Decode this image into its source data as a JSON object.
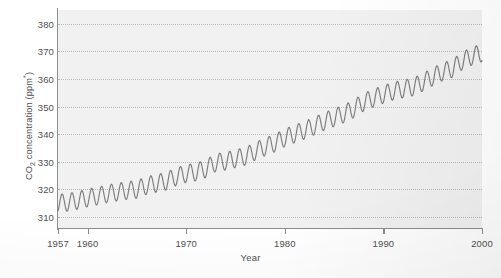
{
  "chart_data": {
    "type": "line",
    "title": "",
    "xlabel": "Year",
    "ylabel": "CO2 concentration (ppm*)",
    "ylabel_parts": {
      "prefix": "CO",
      "subscript": "2",
      "middle": " concentration (ppm",
      "superscript": "*",
      "suffix": ")"
    },
    "xlim": [
      1957,
      2000
    ],
    "ylim": [
      306,
      385
    ],
    "grid": true,
    "grid_axis": "y",
    "legend": "none",
    "yticks": [
      310,
      320,
      330,
      340,
      350,
      360,
      370,
      380
    ],
    "xticks": [
      1957,
      1960,
      1970,
      1980,
      1990,
      2000
    ],
    "series": [
      {
        "name": "Atmospheric CO2 (Mauna Loa)",
        "color": "#7c7c7c",
        "description": "Monthly mean CO2 with seasonal oscillation superimposed on rising annual trend",
        "seasonal_amplitude_ppm": 3.2,
        "seasonal_peak_month": 5,
        "annual_means": [
          {
            "year": 1957,
            "value": 315.0
          },
          {
            "year": 1958,
            "value": 315.3
          },
          {
            "year": 1959,
            "value": 316.0
          },
          {
            "year": 1960,
            "value": 316.9
          },
          {
            "year": 1961,
            "value": 317.6
          },
          {
            "year": 1962,
            "value": 318.4
          },
          {
            "year": 1963,
            "value": 319.0
          },
          {
            "year": 1964,
            "value": 319.6
          },
          {
            "year": 1965,
            "value": 320.0
          },
          {
            "year": 1966,
            "value": 321.4
          },
          {
            "year": 1967,
            "value": 322.2
          },
          {
            "year": 1968,
            "value": 323.0
          },
          {
            "year": 1969,
            "value": 324.6
          },
          {
            "year": 1970,
            "value": 325.7
          },
          {
            "year": 1971,
            "value": 326.3
          },
          {
            "year": 1972,
            "value": 327.5
          },
          {
            "year": 1973,
            "value": 329.7
          },
          {
            "year": 1974,
            "value": 330.2
          },
          {
            "year": 1975,
            "value": 331.1
          },
          {
            "year": 1976,
            "value": 332.0
          },
          {
            "year": 1977,
            "value": 333.8
          },
          {
            "year": 1978,
            "value": 335.4
          },
          {
            "year": 1979,
            "value": 336.8
          },
          {
            "year": 1980,
            "value": 338.7
          },
          {
            "year": 1981,
            "value": 340.1
          },
          {
            "year": 1982,
            "value": 341.4
          },
          {
            "year": 1983,
            "value": 343.0
          },
          {
            "year": 1984,
            "value": 344.6
          },
          {
            "year": 1985,
            "value": 346.0
          },
          {
            "year": 1986,
            "value": 347.4
          },
          {
            "year": 1987,
            "value": 349.2
          },
          {
            "year": 1988,
            "value": 351.6
          },
          {
            "year": 1989,
            "value": 353.1
          },
          {
            "year": 1990,
            "value": 354.4
          },
          {
            "year": 1991,
            "value": 355.6
          },
          {
            "year": 1992,
            "value": 356.4
          },
          {
            "year": 1993,
            "value": 357.1
          },
          {
            "year": 1994,
            "value": 358.8
          },
          {
            "year": 1995,
            "value": 360.8
          },
          {
            "year": 1996,
            "value": 362.6
          },
          {
            "year": 1997,
            "value": 363.8
          },
          {
            "year": 1998,
            "value": 366.6
          },
          {
            "year": 1999,
            "value": 368.3
          },
          {
            "year": 2000,
            "value": 369.5
          }
        ]
      }
    ]
  }
}
